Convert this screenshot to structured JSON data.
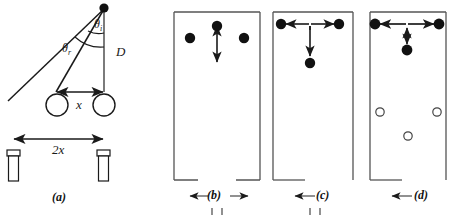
{
  "figure": {
    "width": 455,
    "height": 220,
    "background": "#ffffff",
    "stroke_color": "#1a1a1a",
    "dot_fill": "#111111",
    "box_border": "#555555"
  },
  "panel_a": {
    "caption": "(a)",
    "labels": {
      "angle_outer": "θ",
      "angle_outer_sub": "r",
      "angle_inner": "θ",
      "angle_inner_sub": "i",
      "distance_vertical": "D",
      "separation_small": "x",
      "separation_large": "2x"
    },
    "elements": {
      "apex_dot": "source-point",
      "vertical_line": "depth-line-D",
      "ray_long": "refracted-ray",
      "ray_short": "incident-ray",
      "circle_left": "lens-circle-left",
      "circle_right": "lens-circle-right",
      "cylinder_left": "detector-left",
      "cylinder_right": "detector-right",
      "arrow_x": "separation-arrow-x",
      "arrow_2x": "separation-arrow-2x"
    }
  },
  "panel_b": {
    "caption": "(b)",
    "dots": [
      {
        "name": "dot-left",
        "cx": 24,
        "cy": 32,
        "r": 5.2,
        "filled": true
      },
      {
        "name": "dot-center-top",
        "cx": 52,
        "cy": 23,
        "r": 5.2,
        "filled": true
      },
      {
        "name": "dot-right",
        "cx": 80,
        "cy": 32,
        "r": 5.2,
        "filled": true
      }
    ],
    "arrows": [
      {
        "name": "vertical-double-arrow",
        "orientation": "vertical",
        "x1": 52,
        "y1": 24,
        "x2": 52,
        "y2": 58
      }
    ],
    "bottom_arrows": [
      "left",
      "right"
    ]
  },
  "panel_c": {
    "caption": "(c)",
    "dots": [
      {
        "name": "dot-left",
        "cx": 18,
        "cy": 23,
        "r": 5.2,
        "filled": true
      },
      {
        "name": "dot-right",
        "cx": 80,
        "cy": 23,
        "r": 5.2,
        "filled": true
      },
      {
        "name": "dot-center-bottom",
        "cx": 49,
        "cy": 62,
        "r": 5.2,
        "filled": true
      }
    ],
    "arrows": [
      {
        "name": "horizontal-double-arrow",
        "orientation": "horizontal",
        "x1": 18,
        "y1": 23,
        "x2": 80,
        "y2": 23
      },
      {
        "name": "vertical-double-arrow",
        "orientation": "vertical",
        "x1": 49,
        "y1": 24,
        "x2": 49,
        "y2": 60
      }
    ],
    "bottom_arrows": [
      "left"
    ]
  },
  "panel_d": {
    "caption": "(d)",
    "dots": [
      {
        "name": "dot-left",
        "cx": 16,
        "cy": 23,
        "r": 5.4,
        "filled": true
      },
      {
        "name": "dot-right",
        "cx": 82,
        "cy": 23,
        "r": 5.4,
        "filled": true
      },
      {
        "name": "dot-center-bottom",
        "cx": 49,
        "cy": 45,
        "r": 5.4,
        "filled": true
      }
    ],
    "open_circles": [
      {
        "name": "open-circle-left",
        "cx": 19,
        "cy": 110,
        "r": 4.2
      },
      {
        "name": "open-circle-right",
        "cx": 80,
        "cy": 110,
        "r": 4.2
      },
      {
        "name": "open-circle-center",
        "cx": 49,
        "cy": 133,
        "r": 4.2
      }
    ],
    "arrows": [
      {
        "name": "horizontal-double-arrow",
        "orientation": "horizontal",
        "x1": 16,
        "y1": 23,
        "x2": 82,
        "y2": 23
      },
      {
        "name": "vertical-double-arrow",
        "orientation": "vertical",
        "x1": 49,
        "y1": 26,
        "x2": 49,
        "y2": 43
      }
    ],
    "bottom_arrows": [
      "left"
    ]
  }
}
